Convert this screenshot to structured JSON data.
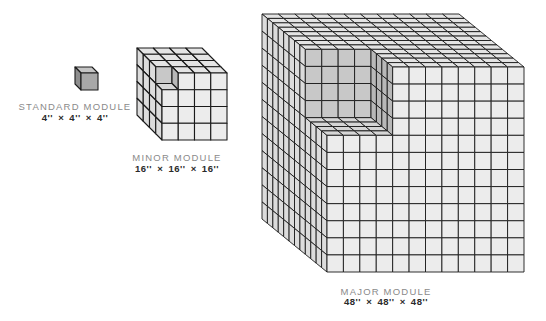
{
  "modules": [
    {
      "id": "standard",
      "name": "STANDARD MODULE",
      "dimensions": "4'' × 4'' × 4''",
      "cube": {
        "fx": 81,
        "fy": 73,
        "size": 17,
        "dx": -6,
        "dy": -6,
        "divisions": 1,
        "notch": 0
      },
      "label_pos": {
        "cx": 75,
        "name_y": 101,
        "dims_y": 113
      }
    },
    {
      "id": "minor",
      "name": "MINOR MODULE",
      "dimensions": "16'' × 16'' × 16''",
      "cube": {
        "fx": 162,
        "fy": 73,
        "size": 65,
        "h": 67,
        "dx": -25,
        "dy": -25,
        "divisions": 4,
        "notch": 1
      },
      "label_pos": {
        "cx": 177,
        "name_y": 152,
        "dims_y": 164
      }
    },
    {
      "id": "major",
      "name": "MAJOR MODULE",
      "dimensions": "48'' × 48'' × 48''",
      "cube": {
        "fx": 327,
        "fy": 67,
        "size": 197,
        "h": 205,
        "dx": -65,
        "dy": -53,
        "divisions": 12,
        "notch": 4
      },
      "label_pos": {
        "cx": 386,
        "name_y": 286,
        "dims_y": 297
      }
    }
  ],
  "colors": {
    "front": "#ececec",
    "side": "#dcdcdc",
    "top": "#e4e4e4",
    "notch_back": "#c8c8c8",
    "notch_side": "#b8b8b8",
    "notch_floor": "#d6d6d6",
    "line": "#1a1a1a",
    "small_front": "#a8a8a8",
    "small_side": "#8e8e8e",
    "small_top": "#c4c4c4"
  }
}
